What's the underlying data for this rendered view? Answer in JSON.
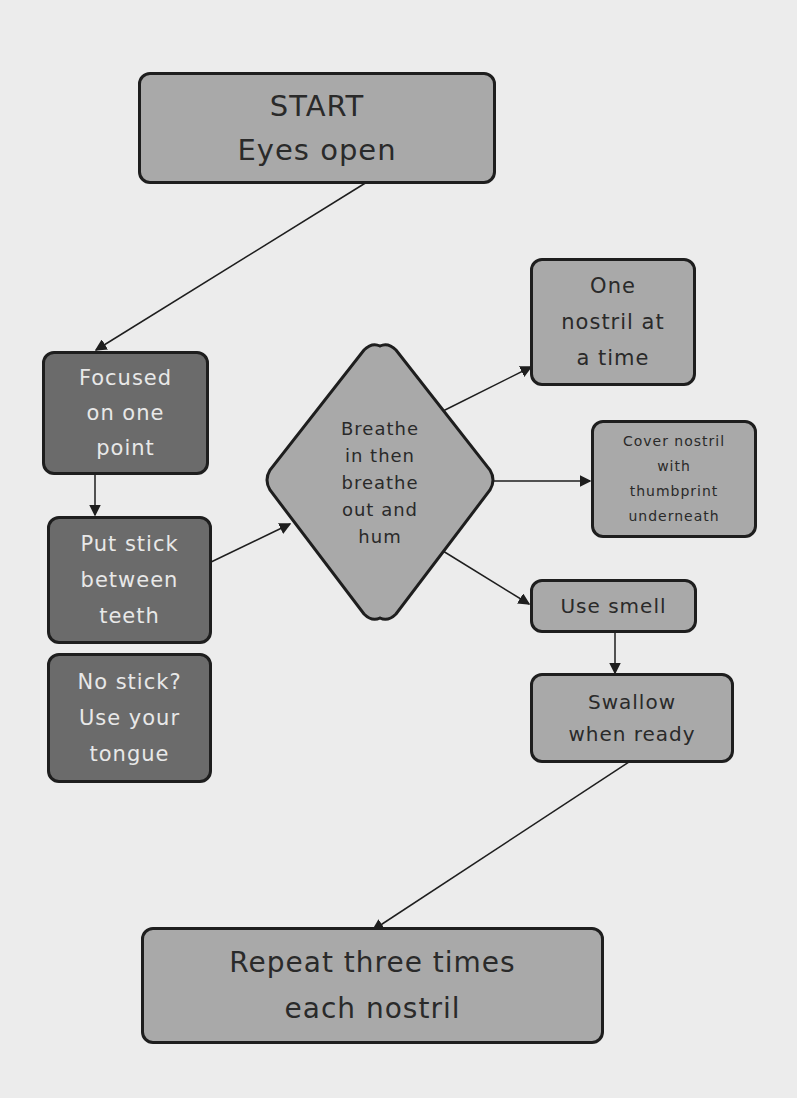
{
  "diagram": {
    "type": "flowchart",
    "colors": {
      "background": "#ececec",
      "light_fill": "#a9a9a9",
      "dark_fill": "#6b6b6b",
      "border": "#1e1e1e"
    },
    "nodes": {
      "start": {
        "label": "START\nEyes open",
        "shape": "rounded-rect",
        "fill": "light"
      },
      "focused": {
        "label": "Focused\non one\npoint",
        "shape": "rounded-rect",
        "fill": "dark"
      },
      "put_stick": {
        "label": "Put stick\nbetween\nteeth",
        "shape": "rounded-rect",
        "fill": "dark"
      },
      "no_stick": {
        "label": "No stick?\nUse your\ntongue",
        "shape": "rounded-rect",
        "fill": "dark"
      },
      "breathe": {
        "label": "Breathe\nin then\nbreathe\nout and\nhum",
        "shape": "diamond",
        "fill": "light"
      },
      "one_nostril": {
        "label": "One\nnostril at\na time",
        "shape": "rounded-rect",
        "fill": "light"
      },
      "cover_nostril": {
        "label": "Cover nostril\nwith\nthumbprint\nunderneath",
        "shape": "rounded-rect",
        "fill": "light"
      },
      "use_smell": {
        "label": "Use smell",
        "shape": "rounded-rect",
        "fill": "light"
      },
      "swallow": {
        "label": "Swallow\nwhen ready",
        "shape": "rounded-rect",
        "fill": "light"
      },
      "repeat": {
        "label": "Repeat three times\neach nostril",
        "shape": "rounded-rect",
        "fill": "light"
      }
    },
    "edges": [
      {
        "from": "start",
        "to": "focused"
      },
      {
        "from": "focused",
        "to": "put_stick"
      },
      {
        "from": "put_stick",
        "to": "breathe"
      },
      {
        "from": "breathe",
        "to": "one_nostril"
      },
      {
        "from": "breathe",
        "to": "cover_nostril"
      },
      {
        "from": "breathe",
        "to": "use_smell"
      },
      {
        "from": "use_smell",
        "to": "swallow"
      },
      {
        "from": "swallow",
        "to": "repeat"
      }
    ]
  }
}
